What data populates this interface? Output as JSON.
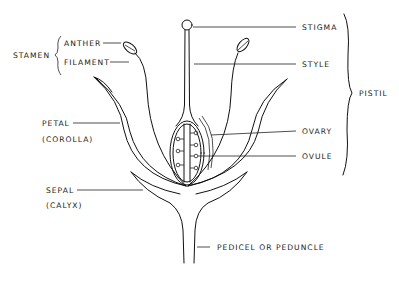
{
  "diagram": {
    "labels": {
      "stamen": "STAMEN",
      "anther": "ANTHER",
      "filament": "FILAMENT",
      "petal": "PETAL",
      "corolla": "(COROLLA)",
      "sepal": "SEPAL",
      "calyx": "(CALYX)",
      "stigma": "STIGMA",
      "style": "STYLE",
      "pistil": "PISTIL",
      "ovary": "OVARY",
      "ovule": "OVULE",
      "pedicel": "PEDICEL OR PEDUNCLE"
    },
    "groups": [
      {
        "name": "STAMEN",
        "parts": [
          "ANTHER",
          "FILAMENT"
        ]
      },
      {
        "name": "PISTIL",
        "parts": [
          "STIGMA",
          "STYLE",
          "OVARY",
          "OVULE"
        ]
      }
    ],
    "colors": {
      "line": "#111111",
      "background": "#ffffff"
    }
  }
}
